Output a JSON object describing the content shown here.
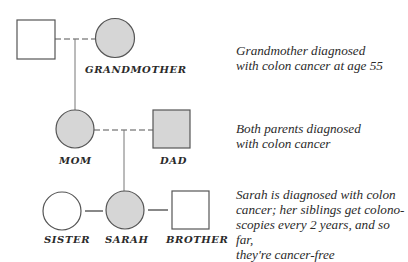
{
  "colors": {
    "affected_fill": "#d6d6d6",
    "unaffected_fill": "#ffffff",
    "stroke": "#555555",
    "text": "#2a2a2a"
  },
  "pedigree": {
    "generations": [
      {
        "members": [
          {
            "id": "grandfather",
            "label": "",
            "sex": "male",
            "affected": false
          },
          {
            "id": "grandmother",
            "label": "GRANDMOTHER",
            "sex": "female",
            "affected": true
          }
        ],
        "caption": [
          "Grandmother diagnosed",
          "with colon cancer at age 55"
        ]
      },
      {
        "members": [
          {
            "id": "mom",
            "label": "MOM",
            "sex": "female",
            "affected": true
          },
          {
            "id": "dad",
            "label": "DAD",
            "sex": "male",
            "affected": true
          }
        ],
        "caption": [
          "Both parents diagnosed",
          "with colon cancer"
        ]
      },
      {
        "members": [
          {
            "id": "sister",
            "label": "SISTER",
            "sex": "female",
            "affected": false
          },
          {
            "id": "sarah",
            "label": "SARAH",
            "sex": "female",
            "affected": true
          },
          {
            "id": "brother",
            "label": "BROTHER",
            "sex": "male",
            "affected": false
          }
        ],
        "caption": [
          "Sarah is diagnosed with colon",
          "cancer; her siblings get colono-",
          "scopies every 2 years, and so far,",
          "they're cancer-free"
        ]
      }
    ]
  }
}
